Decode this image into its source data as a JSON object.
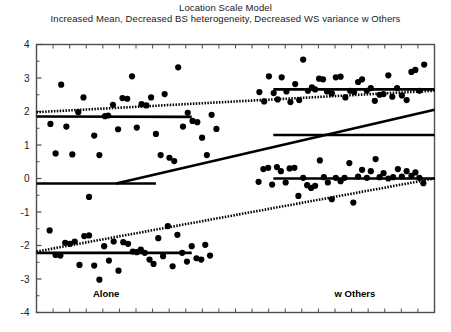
{
  "chart_data": {
    "type": "scatter",
    "title": "Location Scale Model",
    "subtitle": "Increased Mean, Decreased BS heterogeneity, Decreased WS variance w Others",
    "xlabel": "",
    "ylabel": "",
    "ylim": [
      -4,
      4
    ],
    "xlim": [
      0,
      1
    ],
    "yticks": [
      -4,
      -3,
      -2,
      -1,
      0,
      1,
      2,
      3,
      4
    ],
    "ytick_labels": [
      "-4",
      "-3",
      "-2",
      "-1",
      "0",
      "1",
      "2",
      "3",
      "4"
    ],
    "grid": false,
    "legend": "none",
    "group_labels": [
      {
        "text": "Alone",
        "x": 0.175,
        "y": -3.55
      },
      {
        "text": "w Others",
        "x": 0.8,
        "y": -3.55
      }
    ],
    "marker_color": "#000000",
    "line_color": "#000000",
    "frame_color": "#4d4d4d",
    "background": "#ffffff",
    "series": [
      {
        "name": "Alone - high subject",
        "points": [
          [
            0.035,
            1.63
          ],
          [
            0.048,
            0.75
          ],
          [
            0.062,
            2.8
          ],
          [
            0.075,
            1.55
          ],
          [
            0.09,
            0.72
          ],
          [
            0.105,
            1.98
          ],
          [
            0.118,
            2.42
          ],
          [
            0.132,
            -0.55
          ],
          [
            0.145,
            1.28
          ],
          [
            0.158,
            0.7
          ],
          [
            0.172,
            1.86
          ],
          [
            0.18,
            1.88
          ],
          [
            0.192,
            2.2
          ],
          [
            0.205,
            1.47
          ],
          [
            0.216,
            2.4
          ],
          [
            0.228,
            2.38
          ],
          [
            0.24,
            3.05
          ],
          [
            0.252,
            1.52
          ],
          [
            0.264,
            2.22
          ],
          [
            0.276,
            2.18
          ],
          [
            0.288,
            2.42
          ],
          [
            0.3,
            1.33
          ],
          [
            0.312,
            0.7
          ],
          [
            0.322,
            2.52
          ],
          [
            0.334,
            0.62
          ],
          [
            0.346,
            0.52
          ],
          [
            0.356,
            3.32
          ],
          [
            0.368,
            1.55
          ],
          [
            0.38,
            1.96
          ],
          [
            0.392,
            1.72
          ],
          [
            0.404,
            1.68
          ],
          [
            0.416,
            1.22
          ],
          [
            0.428,
            0.7
          ],
          [
            0.44,
            1.9
          ],
          [
            0.452,
            1.48
          ]
        ]
      },
      {
        "name": "Alone - low subject",
        "points": [
          [
            0.033,
            -1.55
          ],
          [
            0.048,
            -2.28
          ],
          [
            0.06,
            -2.3
          ],
          [
            0.072,
            -1.92
          ],
          [
            0.084,
            -1.95
          ],
          [
            0.096,
            -1.88
          ],
          [
            0.108,
            -2.58
          ],
          [
            0.12,
            -1.72
          ],
          [
            0.132,
            -1.7
          ],
          [
            0.145,
            -2.6
          ],
          [
            0.158,
            -3.02
          ],
          [
            0.17,
            -2.02
          ],
          [
            0.182,
            -2.45
          ],
          [
            0.194,
            -1.88
          ],
          [
            0.206,
            -2.75
          ],
          [
            0.218,
            -1.9
          ],
          [
            0.23,
            -1.95
          ],
          [
            0.242,
            -2.18
          ],
          [
            0.252,
            -2.2
          ],
          [
            0.262,
            -2.12
          ],
          [
            0.272,
            -2.22
          ],
          [
            0.284,
            -2.42
          ],
          [
            0.294,
            -2.55
          ],
          [
            0.306,
            -1.78
          ],
          [
            0.318,
            -2.32
          ],
          [
            0.33,
            -1.42
          ],
          [
            0.342,
            -2.62
          ],
          [
            0.354,
            -1.68
          ],
          [
            0.366,
            -2.22
          ],
          [
            0.378,
            -2.48
          ],
          [
            0.39,
            -2.02
          ],
          [
            0.402,
            -2.38
          ],
          [
            0.414,
            -2.42
          ],
          [
            0.424,
            -1.98
          ],
          [
            0.436,
            -2.3
          ]
        ]
      },
      {
        "name": "w Others - high subject",
        "points": [
          [
            0.56,
            2.58
          ],
          [
            0.572,
            2.3
          ],
          [
            0.584,
            3.05
          ],
          [
            0.596,
            2.55
          ],
          [
            0.606,
            2.36
          ],
          [
            0.616,
            3.02
          ],
          [
            0.628,
            2.6
          ],
          [
            0.638,
            2.28
          ],
          [
            0.65,
            2.82
          ],
          [
            0.66,
            2.34
          ],
          [
            0.67,
            3.55
          ],
          [
            0.682,
            2.62
          ],
          [
            0.692,
            2.72
          ],
          [
            0.7,
            2.66
          ],
          [
            0.71,
            2.98
          ],
          [
            0.72,
            2.96
          ],
          [
            0.73,
            2.6
          ],
          [
            0.742,
            2.54
          ],
          [
            0.752,
            3.02
          ],
          [
            0.764,
            3.04
          ],
          [
            0.776,
            2.42
          ],
          [
            0.788,
            2.62
          ],
          [
            0.798,
            2.58
          ],
          [
            0.808,
            2.88
          ],
          [
            0.818,
            2.96
          ],
          [
            0.83,
            2.62
          ],
          [
            0.84,
            2.7
          ],
          [
            0.85,
            2.32
          ],
          [
            0.862,
            2.5
          ],
          [
            0.872,
            2.52
          ],
          [
            0.884,
            3.08
          ],
          [
            0.894,
            2.44
          ],
          [
            0.906,
            2.7
          ],
          [
            0.918,
            2.48
          ],
          [
            0.93,
            2.34
          ],
          [
            0.942,
            3.18
          ],
          [
            0.952,
            3.24
          ],
          [
            0.962,
            2.62
          ],
          [
            0.974,
            3.4
          ]
        ]
      },
      {
        "name": "w Others - low subject",
        "points": [
          [
            0.558,
            -0.1
          ],
          [
            0.57,
            0.28
          ],
          [
            0.582,
            0.32
          ],
          [
            0.592,
            -0.18
          ],
          [
            0.604,
            0.34
          ],
          [
            0.614,
            0.22
          ],
          [
            0.626,
            -0.12
          ],
          [
            0.636,
            0.3
          ],
          [
            0.648,
            0.32
          ],
          [
            0.658,
            -0.52
          ],
          [
            0.67,
            0.02
          ],
          [
            0.68,
            -0.2
          ],
          [
            0.69,
            -0.28
          ],
          [
            0.7,
            -0.22
          ],
          [
            0.712,
            0.54
          ],
          [
            0.722,
            0.04
          ],
          [
            0.732,
            -0.12
          ],
          [
            0.742,
            -0.62
          ],
          [
            0.752,
            0.02
          ],
          [
            0.764,
            -0.08
          ],
          [
            0.774,
            0.02
          ],
          [
            0.786,
            0.46
          ],
          [
            0.796,
            -0.72
          ],
          [
            0.808,
            0.06
          ],
          [
            0.818,
            0.26
          ],
          [
            0.83,
            0.02
          ],
          [
            0.84,
            0.22
          ],
          [
            0.852,
            0.58
          ],
          [
            0.862,
            0.04
          ],
          [
            0.872,
            0.16
          ],
          [
            0.884,
            0.0
          ],
          [
            0.896,
            0.04
          ],
          [
            0.908,
            0.28
          ],
          [
            0.918,
            0.06
          ],
          [
            0.93,
            0.22
          ],
          [
            0.942,
            0.08
          ],
          [
            0.952,
            0.18
          ],
          [
            0.962,
            0.02
          ],
          [
            0.972,
            -0.14
          ]
        ]
      }
    ],
    "fit_lines": [
      {
        "name": "alone-high-dotted",
        "style": "dotted",
        "x1": 0.0,
        "y1": 1.98,
        "x2": 1.0,
        "y2": 2.62
      },
      {
        "name": "alone-high-solid",
        "style": "solid",
        "x1": 0.0,
        "y1": 1.85,
        "x2": 0.39,
        "y2": 1.84
      },
      {
        "name": "wothers-high-solid",
        "style": "solid",
        "x1": 0.595,
        "y1": 2.66,
        "x2": 1.0,
        "y2": 2.66
      },
      {
        "name": "alone-low-dotted",
        "style": "dotted",
        "x1": 0.0,
        "y1": -2.18,
        "x2": 1.0,
        "y2": 0.0
      },
      {
        "name": "alone-low-solid",
        "style": "solid",
        "x1": 0.0,
        "y1": -2.22,
        "x2": 0.39,
        "y2": -2.22
      },
      {
        "name": "wothers-low-solid",
        "style": "solid",
        "x1": 0.595,
        "y1": 0.0,
        "x2": 1.0,
        "y2": 0.0
      },
      {
        "name": "overall-mean-alone",
        "style": "solid",
        "x1": 0.0,
        "y1": -0.15,
        "x2": 0.3,
        "y2": -0.15
      },
      {
        "name": "overall-mean-trend",
        "style": "solid",
        "x1": 0.2,
        "y1": -0.15,
        "x2": 1.0,
        "y2": 2.05
      },
      {
        "name": "overall-mean-wothers",
        "style": "solid",
        "x1": 0.595,
        "y1": 1.3,
        "x2": 1.0,
        "y2": 1.3
      }
    ]
  }
}
